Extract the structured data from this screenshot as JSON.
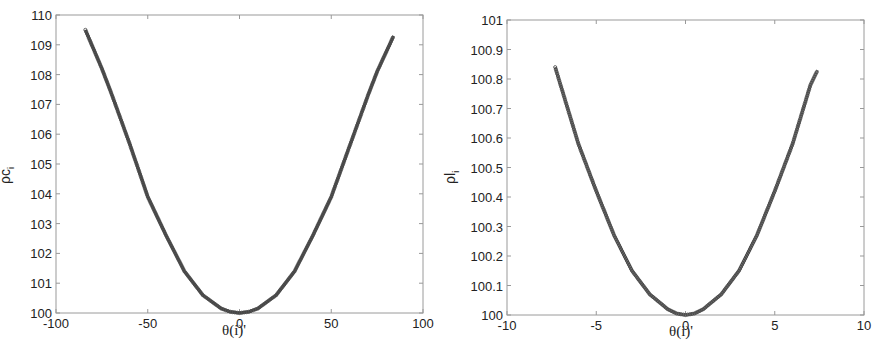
{
  "chart_data": [
    {
      "type": "line",
      "title": "",
      "xlabel": "θ(i)'",
      "ylabel": "ρc_i",
      "ylabel_main": "ρc",
      "ylabel_sub": "i",
      "xlim": [
        -100,
        100
      ],
      "ylim": [
        100,
        110
      ],
      "xticks": [
        -100,
        -50,
        0,
        50,
        100
      ],
      "xtick_labels": [
        "-100",
        "-50",
        "0",
        "50",
        "100"
      ],
      "yticks": [
        100,
        101,
        102,
        103,
        104,
        105,
        106,
        107,
        108,
        109,
        110
      ],
      "ytick_labels": [
        "100",
        "101",
        "102",
        "103",
        "104",
        "105",
        "106",
        "107",
        "108",
        "109",
        "110"
      ],
      "grid": false,
      "legend": null,
      "series": [
        {
          "name": "ρc_i",
          "color": "#555555",
          "marker": "o",
          "x": [
            -84,
            -75,
            -70,
            -60,
            -50,
            -40,
            -30,
            -25,
            -20,
            -10,
            -5,
            0,
            5,
            10,
            20,
            25,
            30,
            40,
            50,
            60,
            70,
            75,
            84
          ],
          "y": [
            109.5,
            108.2,
            107.4,
            105.7,
            103.9,
            102.6,
            101.4,
            101.0,
            100.6,
            100.15,
            100.04,
            100.0,
            100.04,
            100.15,
            100.6,
            101.0,
            101.4,
            102.6,
            103.9,
            105.6,
            107.3,
            108.1,
            109.3
          ]
        }
      ]
    },
    {
      "type": "line",
      "title": "",
      "xlabel": "θ(i)'",
      "ylabel": "ρl_i",
      "ylabel_main": "ρl",
      "ylabel_sub": "i",
      "xlim": [
        -10,
        10
      ],
      "ylim": [
        100,
        101
      ],
      "xticks": [
        -10,
        -5,
        0,
        5,
        10
      ],
      "xtick_labels": [
        "-10",
        "-5",
        "0",
        "5",
        "10"
      ],
      "yticks": [
        100,
        100.1,
        100.2,
        100.3,
        100.4,
        100.5,
        100.6,
        100.7,
        100.8,
        100.9,
        101
      ],
      "ytick_labels": [
        "100",
        "100.1",
        "100.2",
        "100.3",
        "100.4",
        "100.5",
        "100.6",
        "100.7",
        "100.8",
        "100.9",
        "101"
      ],
      "grid": false,
      "legend": null,
      "series": [
        {
          "name": "ρl_i",
          "color": "#777777",
          "marker": "o",
          "x": [
            -7.3,
            -7,
            -6,
            -5,
            -4,
            -3,
            -2.5,
            -2,
            -1,
            -0.5,
            0,
            0.5,
            1,
            2,
            2.5,
            3,
            4,
            5,
            6,
            7,
            7.4
          ],
          "y": [
            100.84,
            100.78,
            100.58,
            100.42,
            100.27,
            100.15,
            100.11,
            100.07,
            100.02,
            100.005,
            100.0,
            100.005,
            100.02,
            100.07,
            100.11,
            100.15,
            100.27,
            100.42,
            100.58,
            100.78,
            100.83
          ]
        }
      ]
    }
  ]
}
